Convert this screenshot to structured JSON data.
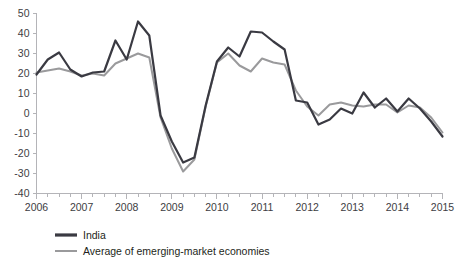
{
  "chart_data": {
    "type": "line",
    "title": "",
    "subtitle": "",
    "xlabel": "",
    "ylabel": "",
    "ylim": [
      -40,
      50
    ],
    "xlim": [
      2006.0,
      2015.0
    ],
    "grid": false,
    "legend_position": "bottom-left",
    "y_ticks": [
      50,
      40,
      30,
      20,
      10,
      0,
      -10,
      -20,
      -30,
      -40
    ],
    "y_tick_labels": [
      "50",
      "40",
      "30",
      "20",
      "10",
      "0",
      "-10",
      "-20",
      "-30",
      "-40"
    ],
    "x_ticks": [
      2006,
      2007,
      2008,
      2009,
      2010,
      2011,
      2012,
      2013,
      2014,
      2015
    ],
    "x_tick_labels": [
      "2006",
      "2007",
      "2008",
      "2009",
      "2010",
      "2011",
      "2012",
      "2013",
      "2014",
      "2015"
    ],
    "x_minor_ticks_per_year": 4,
    "x": [
      2006.0,
      2006.25,
      2006.5,
      2006.75,
      2007.0,
      2007.25,
      2007.5,
      2007.75,
      2008.0,
      2008.25,
      2008.5,
      2008.75,
      2009.0,
      2009.25,
      2009.5,
      2009.75,
      2010.0,
      2010.25,
      2010.5,
      2010.75,
      2011.0,
      2011.25,
      2011.5,
      2011.75,
      2012.0,
      2012.25,
      2012.5,
      2012.75,
      2013.0,
      2013.25,
      2013.5,
      2013.75,
      2014.0,
      2014.25,
      2014.5,
      2014.75,
      2015.0
    ],
    "series": [
      {
        "name": "India",
        "color": "#3a3a42",
        "width": 2.2,
        "values": [
          19.5,
          27.0,
          30.5,
          22.0,
          18.5,
          20.5,
          21.0,
          36.5,
          27.0,
          46.0,
          39.0,
          -1.0,
          -14.0,
          -24.5,
          -22.0,
          4.0,
          26.0,
          33.0,
          28.5,
          41.0,
          40.5,
          36.0,
          32.0,
          6.5,
          5.5,
          -5.5,
          -3.0,
          2.5,
          0.0,
          10.5,
          3.0,
          7.5,
          1.0,
          7.5,
          2.5,
          -4.0,
          -11.5
        ]
      },
      {
        "name": "Average of emerging-market economies",
        "color": "#9a9a9c",
        "width": 2.0,
        "values": [
          20.5,
          21.5,
          22.5,
          21.0,
          19.0,
          20.0,
          19.0,
          25.0,
          27.5,
          30.0,
          28.0,
          -2.0,
          -17.5,
          -29.0,
          -23.0,
          3.5,
          25.5,
          30.0,
          24.0,
          21.0,
          27.5,
          25.5,
          24.5,
          11.5,
          3.5,
          -1.0,
          4.5,
          5.5,
          4.0,
          3.5,
          4.5,
          4.5,
          0.5,
          4.0,
          3.0,
          -2.0,
          -9.5
        ]
      }
    ],
    "legend": [
      {
        "label": "India",
        "color": "#3a3a42",
        "swatch": "thick-line"
      },
      {
        "label": "Average of emerging-market economies",
        "color": "#9a9a9c",
        "swatch": "thin-line"
      }
    ]
  },
  "colors": {
    "india": "#3a3a42",
    "emerging": "#9a9a9c",
    "axis": "#b4b4b8",
    "text": "#231f20",
    "background": "#ffffff"
  }
}
